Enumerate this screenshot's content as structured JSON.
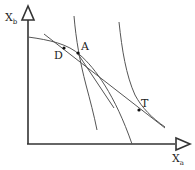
{
  "diagram": {
    "axes": {
      "y_label_main": "X",
      "y_label_sub": "b",
      "x_label_main": "X",
      "x_label_sub": "a"
    },
    "points": [
      {
        "id": "D",
        "label": "D"
      },
      {
        "id": "A",
        "label": "A"
      },
      {
        "id": "T",
        "label": "T"
      }
    ],
    "colors": {
      "axis": "#333333",
      "curve": "#555555",
      "point": "#111111",
      "background": "#ffffff"
    }
  }
}
